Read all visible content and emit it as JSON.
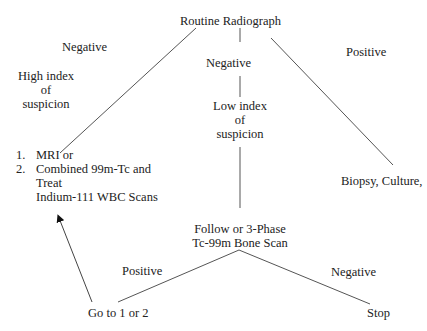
{
  "diagram": {
    "root": "Routine Radiograph",
    "branches": {
      "left": {
        "label": "Negative",
        "condition": [
          "High index",
          "of",
          "suspicion"
        ],
        "options": [
          {
            "num": "1.",
            "text": "MRI or"
          },
          {
            "num": "2.",
            "text": "Combined 99m-Tc and"
          }
        ],
        "options_cont": [
          "Treat",
          "Indium-111 WBC Scans"
        ]
      },
      "middle": {
        "label": "Negative",
        "condition": [
          "Low index",
          "of",
          "suspicion"
        ],
        "next": [
          "Follow or 3-Phase",
          "Tc-99m Bone Scan"
        ],
        "outcomes": {
          "positive_label": "Positive",
          "positive_result": "Go to 1 or 2",
          "negative_label": "Negative",
          "negative_result": "Stop"
        }
      },
      "right": {
        "label": "Positive",
        "result": "Biopsy, Culture,"
      }
    },
    "colors": {
      "line": "#555555",
      "text": "#222222",
      "background": "#ffffff"
    }
  }
}
